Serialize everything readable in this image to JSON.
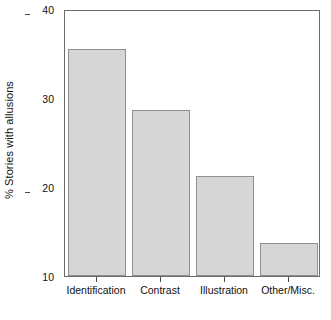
{
  "chart_data": {
    "type": "bar",
    "title": "",
    "xlabel": "",
    "ylabel": "% Stories with allusions",
    "categories": [
      "Identification",
      "Contrast",
      "Illustration",
      "Other/Misc."
    ],
    "values": [
      35.5,
      28.6,
      21.2,
      13.7
    ],
    "ylim": [
      10,
      40
    ],
    "yticks": [
      10,
      20,
      30,
      40
    ],
    "ytick_labels": [
      "10",
      "20",
      "30",
      "40"
    ],
    "grid": false,
    "legend": null,
    "bar_fill_color": "#d6d6d6",
    "bar_edge_color": "#8f8f8f",
    "axis_color": "#6b6b6b",
    "text_color": "#111111",
    "background_color": "#ffffff"
  }
}
